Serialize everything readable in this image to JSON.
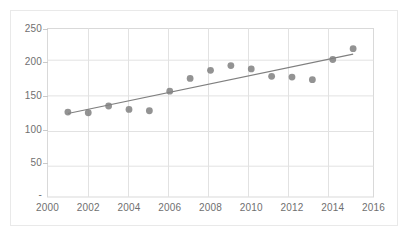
{
  "chart_data": {
    "type": "scatter",
    "title": "",
    "xlabel": "",
    "ylabel": "",
    "x": [
      2001,
      2002,
      2003,
      2004,
      2005,
      2006,
      2007,
      2008,
      2009,
      2010,
      2011,
      2012,
      2013,
      2014,
      2015
    ],
    "values": [
      126,
      125,
      135,
      130,
      128,
      157,
      176,
      188,
      195,
      190,
      179,
      178,
      174,
      204,
      220
    ],
    "series": [
      {
        "name": "data",
        "values": [
          126,
          125,
          135,
          130,
          128,
          157,
          176,
          188,
          195,
          190,
          179,
          178,
          174,
          204,
          220
        ]
      },
      {
        "name": "linear-trendline",
        "x": [
          2001,
          2015
        ],
        "values": [
          124,
          212
        ]
      }
    ],
    "xlim": [
      2000,
      2016
    ],
    "ylim": [
      0,
      250
    ],
    "xticks": [
      2000,
      2002,
      2004,
      2006,
      2008,
      2010,
      2012,
      2014,
      2016
    ],
    "yticks": [
      50,
      100,
      150,
      200,
      250
    ],
    "ytick_labels": [
      "50",
      "100",
      "150",
      "200",
      "250"
    ],
    "xtick_labels": [
      "2000",
      "2002",
      "2004",
      "2006",
      "2008",
      "2010",
      "2012",
      "2014",
      "2016"
    ],
    "grid": true,
    "grid_axis": "both",
    "legend": "none",
    "marker_color": "#808080",
    "trendline_color": "#7f7f7f",
    "grid_color": "#d9d9d9",
    "axis_text_color": "#6f6f6f",
    "background_color": "#ffffff",
    "marker_size": 6,
    "annotations": []
  },
  "axes": {
    "y_axis_label_texts": [
      "250",
      "200",
      "150",
      "100",
      "50",
      "-"
    ],
    "x_axis_label_texts": [
      "2000",
      "2002",
      "2004",
      "2006",
      "2008",
      "2010",
      "2012",
      "2014",
      "2016"
    ]
  }
}
